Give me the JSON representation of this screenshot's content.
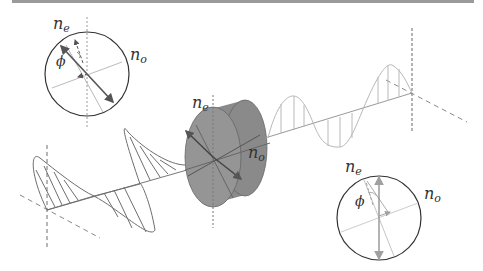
{
  "figure": {
    "colors": {
      "top_rule": "#9a9a9a",
      "input_wave": "#6e6e6e",
      "output_wave": "#b8b8b8",
      "plate_fill": "#8f8f8f",
      "plate_edge": "#666666",
      "axis": "#777777",
      "circle": "#333333",
      "arrow_dark": "#555555",
      "arrow_light": "#a0a0a0"
    },
    "labels": {
      "ne_symbol": "n",
      "ne_sub": "e",
      "no_symbol": "n",
      "no_sub": "o",
      "phi": "ϕ"
    },
    "inset_input": {
      "ne": "n",
      "ne_sub": "e",
      "no": "n",
      "no_sub": "o",
      "angle": "ϕ"
    },
    "plate": {
      "ne": "n",
      "ne_sub": "e",
      "no": "n",
      "no_sub": "o"
    },
    "inset_output": {
      "ne": "n",
      "ne_sub": "e",
      "no": "n",
      "no_sub": "o",
      "angle": "ϕ"
    }
  }
}
